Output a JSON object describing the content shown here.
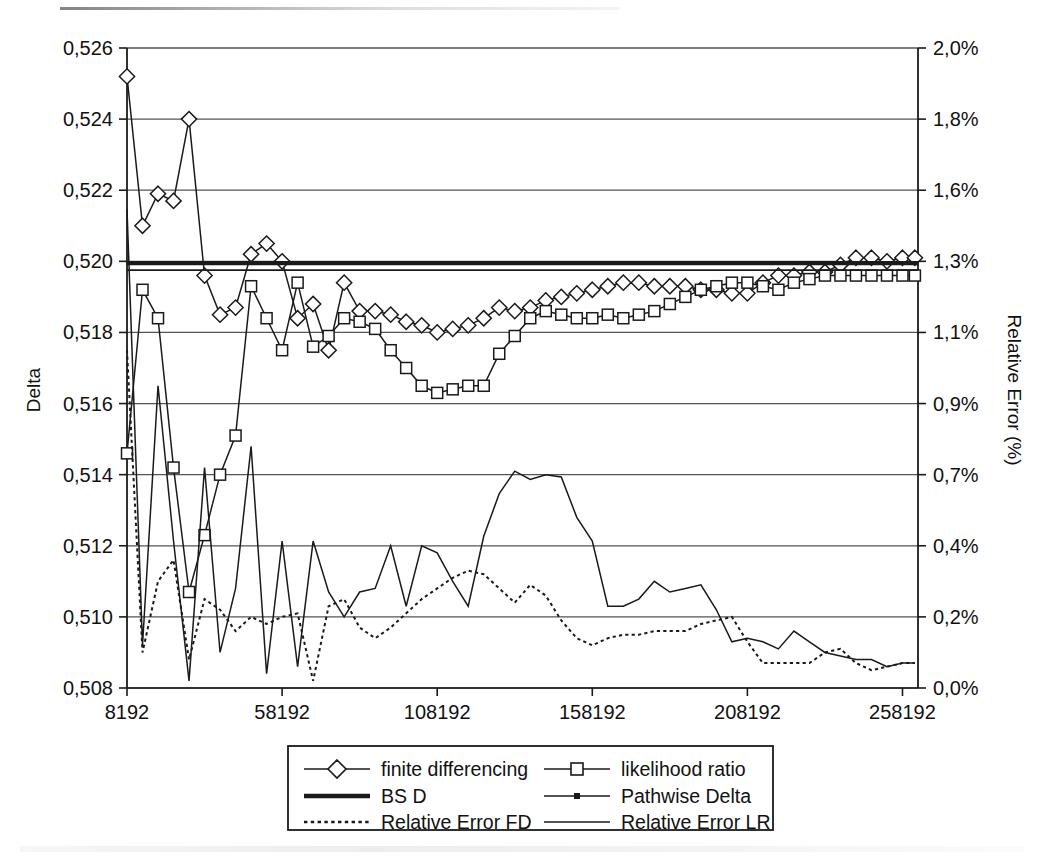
{
  "chart_data": {
    "type": "line",
    "title": "",
    "xlabel": "",
    "ylabel": "Delta",
    "y2label": "Relative Error (%)",
    "x_tick_labels": [
      "8192",
      "58192",
      "108192",
      "158192",
      "208192",
      "258192"
    ],
    "x_tick_values": [
      8192,
      58192,
      108192,
      158192,
      208192,
      258192
    ],
    "xlim": [
      8192,
      263192
    ],
    "y_tick_labels": [
      "0,508",
      "0,510",
      "0,512",
      "0,514",
      "0,516",
      "0,518",
      "0,520",
      "0,522",
      "0,524",
      "0,526"
    ],
    "y_tick_values": [
      0.508,
      0.51,
      0.512,
      0.514,
      0.516,
      0.518,
      0.52,
      0.522,
      0.524,
      0.526
    ],
    "ylim": [
      0.508,
      0.526
    ],
    "y2_tick_labels": [
      "0,0%",
      "0,2%",
      "0,4%",
      "0,7%",
      "0,9%",
      "1,1%",
      "1,3%",
      "1,6%",
      "1,8%",
      "2,0%"
    ],
    "y2_tick_values": [
      0.0,
      0.2,
      0.4,
      0.7,
      0.9,
      1.1,
      1.3,
      1.6,
      1.8,
      2.0
    ],
    "y2lim": [
      0.0,
      2.0
    ],
    "grid": true,
    "legend_position": "bottom",
    "x": [
      8192,
      13192,
      18192,
      23192,
      28192,
      33192,
      38192,
      43192,
      48192,
      53192,
      58192,
      63192,
      68192,
      73192,
      78192,
      83192,
      88192,
      93192,
      98192,
      103192,
      108192,
      113192,
      118192,
      123192,
      128192,
      133192,
      138192,
      143192,
      148192,
      153192,
      158192,
      163192,
      168192,
      173192,
      178192,
      183192,
      188192,
      193192,
      198192,
      203192,
      208192,
      213192,
      218192,
      223192,
      228192,
      233192,
      238192,
      243192,
      248192,
      253192,
      258192,
      262192
    ],
    "series": [
      {
        "name": "finite differencing",
        "axis": "left",
        "marker": "diamond",
        "style": "solid",
        "values": [
          0.5252,
          0.521,
          0.5219,
          0.5217,
          0.524,
          0.5196,
          0.5185,
          0.5187,
          0.5202,
          0.5205,
          0.52,
          0.5184,
          0.5188,
          0.5175,
          0.5194,
          0.5186,
          0.5186,
          0.5185,
          0.5183,
          0.5182,
          0.518,
          0.5181,
          0.5182,
          0.5184,
          0.5187,
          0.5186,
          0.5187,
          0.5189,
          0.519,
          0.5191,
          0.5192,
          0.5193,
          0.5194,
          0.5194,
          0.5193,
          0.5193,
          0.5193,
          0.5192,
          0.5192,
          0.5191,
          0.5191,
          0.5194,
          0.5196,
          0.5196,
          0.5197,
          0.5197,
          0.5199,
          0.5201,
          0.5201,
          0.52,
          0.5201,
          0.5201
        ]
      },
      {
        "name": "likelihood ratio",
        "axis": "left",
        "marker": "square",
        "style": "solid",
        "values": [
          0.5146,
          0.5192,
          0.5184,
          0.5142,
          0.5107,
          0.5123,
          0.514,
          0.5151,
          0.5193,
          0.5184,
          0.5175,
          0.5194,
          0.5176,
          0.5179,
          0.5184,
          0.5183,
          0.5181,
          0.5175,
          0.517,
          0.5165,
          0.5163,
          0.5164,
          0.5165,
          0.5165,
          0.5174,
          0.5179,
          0.5184,
          0.5186,
          0.5185,
          0.5184,
          0.5184,
          0.5185,
          0.5184,
          0.5185,
          0.5186,
          0.5188,
          0.519,
          0.5192,
          0.5193,
          0.5194,
          0.5194,
          0.5193,
          0.5192,
          0.5194,
          0.5195,
          0.5196,
          0.5196,
          0.5196,
          0.5196,
          0.5196,
          0.5196,
          0.5196
        ]
      },
      {
        "name": "BS D",
        "axis": "left",
        "marker": "none",
        "style": "thick",
        "constant": 0.51995
      },
      {
        "name": "Pathwise Delta",
        "axis": "left",
        "marker": "tiny-square",
        "style": "solid",
        "constant": 0.51985
      },
      {
        "name": "Relative Error FD",
        "axis": "right",
        "marker": "none",
        "style": "dotted",
        "values": [
          1.05,
          0.1,
          0.3,
          0.36,
          0.08,
          0.25,
          0.22,
          0.16,
          0.2,
          0.18,
          0.2,
          0.21,
          0.02,
          0.23,
          0.25,
          0.17,
          0.14,
          0.17,
          0.21,
          0.25,
          0.28,
          0.31,
          0.33,
          0.32,
          0.28,
          0.24,
          0.29,
          0.26,
          0.19,
          0.14,
          0.12,
          0.14,
          0.15,
          0.15,
          0.16,
          0.16,
          0.16,
          0.18,
          0.19,
          0.2,
          0.13,
          0.07,
          0.07,
          0.07,
          0.07,
          0.1,
          0.11,
          0.07,
          0.05,
          0.06,
          0.07,
          0.07
        ]
      },
      {
        "name": "Relative Error LR",
        "axis": "right",
        "marker": "none",
        "style": "thin",
        "values": [
          1.52,
          0.12,
          0.95,
          0.42,
          0.02,
          0.72,
          0.1,
          0.28,
          0.78,
          0.04,
          0.42,
          0.06,
          0.42,
          0.27,
          0.2,
          0.27,
          0.28,
          0.4,
          0.23,
          0.4,
          0.38,
          0.3,
          0.23,
          0.44,
          0.62,
          0.71,
          0.68,
          0.7,
          0.69,
          0.52,
          0.42,
          0.23,
          0.23,
          0.25,
          0.3,
          0.27,
          0.28,
          0.29,
          0.22,
          0.13,
          0.14,
          0.13,
          0.11,
          0.16,
          0.13,
          0.1,
          0.09,
          0.08,
          0.08,
          0.06,
          0.07,
          0.07
        ]
      }
    ]
  },
  "legend": {
    "items": [
      {
        "label": "finite differencing",
        "key": "finite-differencing"
      },
      {
        "label": "likelihood ratio",
        "key": "likelihood-ratio"
      },
      {
        "label": "BS D",
        "key": "bs-d"
      },
      {
        "label": "Pathwise Delta",
        "key": "pathwise-delta"
      },
      {
        "label": "Relative Error FD",
        "key": "relative-error-fd"
      },
      {
        "label": "Relative Error LR",
        "key": "relative-error-lr"
      }
    ]
  },
  "colors": {
    "ink": "#1a1a1a",
    "grid": "#555555",
    "background": "#ffffff"
  }
}
